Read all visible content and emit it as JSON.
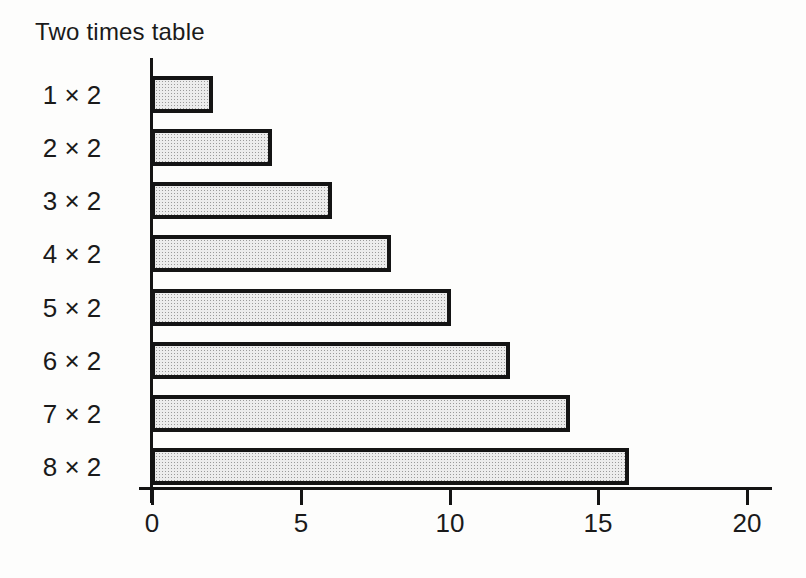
{
  "chart_data": {
    "type": "bar",
    "orientation": "horizontal",
    "title": "Two times table",
    "categories": [
      "1 × 2",
      "2 × 2",
      "3 × 2",
      "4 × 2",
      "5 × 2",
      "6 × 2",
      "7 × 2",
      "8 × 2"
    ],
    "values": [
      2,
      4,
      6,
      8,
      10,
      12,
      14,
      16
    ],
    "x_ticks": [
      0,
      5,
      10,
      15,
      20
    ],
    "xlim": [
      0,
      20
    ],
    "xlabel": "",
    "ylabel": "",
    "grid": false,
    "legend": null,
    "colors": {
      "background": "#fdfdfc",
      "outline": "#141414",
      "bar_fill": "#ececec",
      "bar_dot": "#9a9a9a",
      "text": "#1a1a1a"
    }
  }
}
